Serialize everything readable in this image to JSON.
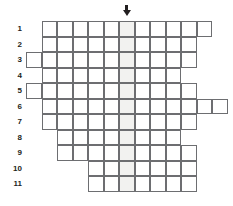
{
  "puzzle": {
    "kind": "crossword-skeleton-grid",
    "title": "",
    "cell_size": 15.5,
    "origin": {
      "x": 26,
      "y": 21
    },
    "columns": 14,
    "highlight_color": "#f2f2f0",
    "grid_line_color": "#6d6e71",
    "label_color": "#231f20",
    "highlight_column_index": 6,
    "arrow": {
      "name": "down-arrow-indicator",
      "glyph": "↓",
      "column_index": 6
    },
    "row_labels": [
      "1",
      "2",
      "3",
      "4",
      "5",
      "6",
      "7",
      "8",
      "9",
      "10",
      "11"
    ],
    "rows": [
      {
        "label": "1",
        "start_col": 1,
        "length": 11
      },
      {
        "label": "2",
        "start_col": 1,
        "length": 10
      },
      {
        "label": "3",
        "start_col": 0,
        "length": 11
      },
      {
        "label": "4",
        "start_col": 1,
        "length": 9
      },
      {
        "label": "5",
        "start_col": 0,
        "length": 11
      },
      {
        "label": "6",
        "start_col": 1,
        "length": 12
      },
      {
        "label": "7",
        "start_col": 1,
        "length": 10
      },
      {
        "label": "8",
        "start_col": 2,
        "length": 8
      },
      {
        "label": "9",
        "start_col": 2,
        "length": 9
      },
      {
        "label": "10",
        "start_col": 4,
        "length": 7
      },
      {
        "label": "11",
        "start_col": 4,
        "length": 7
      }
    ]
  }
}
